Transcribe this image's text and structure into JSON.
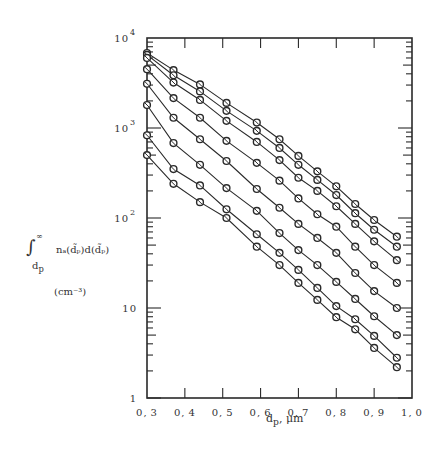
{
  "chart_data": {
    "type": "line",
    "title": "",
    "xlabel": "d_p, μm",
    "ylabel": "∫_{d_p}^{∞} n_d(d̃_p) d(d̃_p)  (cm^-3)",
    "xscale": "linear",
    "yscale": "log",
    "xlim": [
      0.3,
      1.0
    ],
    "ylim": [
      1,
      10000
    ],
    "grid": false,
    "legend": null,
    "marker": "circle-with-slash",
    "x_ticks": [
      "0.3",
      "0.4",
      "0.5",
      "0.6",
      "0.7",
      "0.8",
      "0.9",
      "1.0"
    ],
    "y_ticks": [
      "1",
      "10",
      "10^2",
      "10^3",
      "10^4"
    ],
    "x": [
      0.3,
      0.37,
      0.44,
      0.51,
      0.59,
      0.65,
      0.7,
      0.75,
      0.8,
      0.85,
      0.9,
      0.96
    ],
    "series": [
      {
        "name": "curve 1",
        "values": [
          6800,
          4400,
          3050,
          1900,
          1150,
          750,
          490,
          330,
          225,
          143,
          95,
          62
        ]
      },
      {
        "name": "curve 2",
        "values": [
          6500,
          3850,
          2550,
          1550,
          930,
          600,
          390,
          265,
          180,
          113,
          74,
          48
        ]
      },
      {
        "name": "curve 3",
        "values": [
          6000,
          3200,
          2050,
          1200,
          700,
          440,
          280,
          200,
          135,
          86,
          55,
          34
        ]
      },
      {
        "name": "curve 4",
        "values": [
          4500,
          2150,
          1300,
          720,
          410,
          260,
          165,
          110,
          80,
          48,
          30,
          19
        ]
      },
      {
        "name": "curve 5",
        "values": [
          3100,
          1300,
          750,
          430,
          210,
          130,
          86,
          60,
          41,
          24.5,
          15.4,
          10
        ]
      },
      {
        "name": "curve 6",
        "values": [
          1800,
          680,
          390,
          215,
          120,
          68,
          44,
          30,
          19.5,
          12.6,
          8.1,
          5.0
        ]
      },
      {
        "name": "curve 7",
        "values": [
          830,
          350,
          230,
          125,
          66,
          41,
          26.5,
          16.7,
          10.5,
          7.5,
          4.9,
          2.8
        ]
      },
      {
        "name": "curve 8",
        "values": [
          500,
          240,
          150,
          100,
          48,
          30,
          19,
          12.3,
          7.9,
          5.8,
          3.6,
          2.2
        ]
      }
    ]
  },
  "axes": {
    "x_tick_labels": [
      "0.3",
      "0.4",
      "0.5",
      "0.6",
      "0.7",
      "0.8",
      "0.9",
      "1.0"
    ],
    "y_tick_labels": [
      {
        "base": "1",
        "exp": ""
      },
      {
        "base": "10",
        "exp": ""
      },
      {
        "base": "10",
        "exp": "2"
      },
      {
        "base": "10",
        "exp": "3"
      },
      {
        "base": "10",
        "exp": "4"
      }
    ],
    "x_title": "d",
    "x_title_sub": "p",
    "x_title_unit": ", μm",
    "y_title_integral": "∫",
    "y_title_upper": "∞",
    "y_title_lower": "d",
    "y_title_lower_sub": "p",
    "y_title_expr": "nₐ(d̃ₚ)d(d̃ₚ)",
    "y_title_unit": "(cm⁻³)"
  },
  "colors": {
    "ink": "#2a2a2a",
    "background": "#ffffff"
  }
}
